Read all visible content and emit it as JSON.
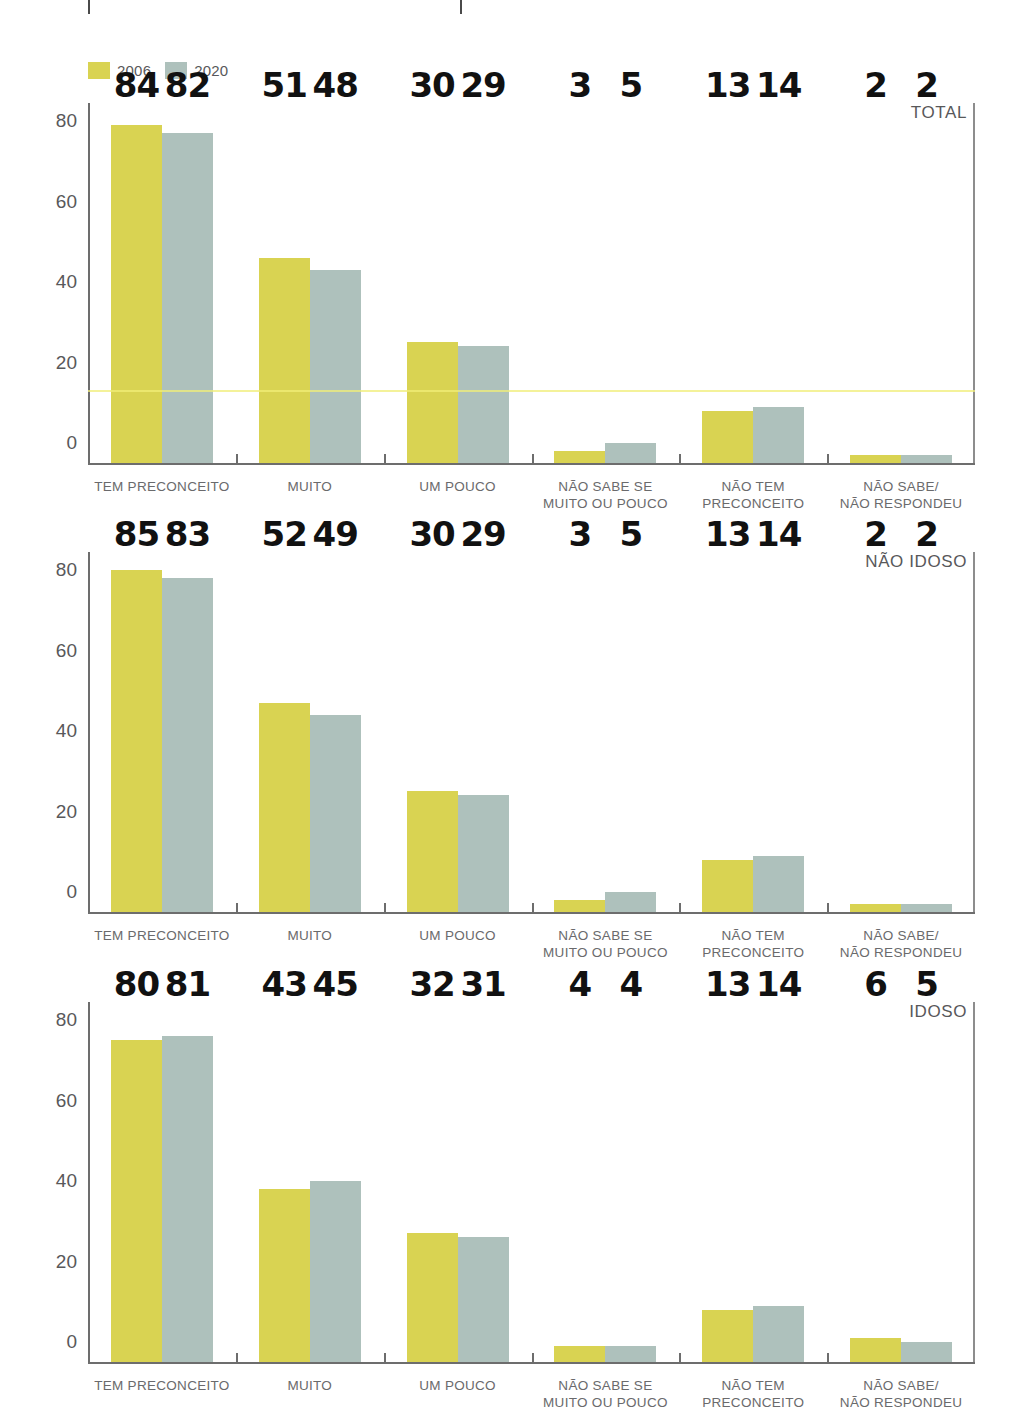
{
  "legend": {
    "items": [
      {
        "label": "2006",
        "color": "#d9d352"
      },
      {
        "label": "2020",
        "color": "#aec1bc"
      }
    ]
  },
  "colors": {
    "series_2006": "#d9d352",
    "series_2020": "#aec1bc",
    "axis": "#6d6d6d",
    "value_label": "#111111",
    "tick_label": "#58585a",
    "category_label": "#6a6a6c"
  },
  "chart_data": [
    {
      "type": "bar",
      "title": "TOTAL",
      "xlabel": "",
      "ylabel": "",
      "ylim": [
        0,
        90
      ],
      "yticks": [
        "0",
        "20",
        "40",
        "60",
        "80"
      ],
      "grid": false,
      "legend_position": "top-left",
      "categories": [
        "TEM PRECONCEITO",
        "MUITO",
        "UM POUCO",
        "NÃO SABE SE\nMUITO OU POUCO",
        "NÃO TEM\nPRECONCEITO",
        "NÃO SABE/\nNÃO RESPONDEU"
      ],
      "series": [
        {
          "name": "2006",
          "values": [
            84,
            51,
            30,
            3,
            13,
            2
          ]
        },
        {
          "name": "2020",
          "values": [
            82,
            48,
            29,
            5,
            14,
            2
          ]
        }
      ]
    },
    {
      "type": "bar",
      "title": "NÃO IDOSO",
      "xlabel": "",
      "ylabel": "",
      "ylim": [
        0,
        90
      ],
      "yticks": [
        "0",
        "20",
        "40",
        "60",
        "80"
      ],
      "grid": false,
      "legend_position": "none",
      "categories": [
        "TEM PRECONCEITO",
        "MUITO",
        "UM POUCO",
        "NÃO SABE SE\nMUITO OU POUCO",
        "NÃO TEM\nPRECONCEITO",
        "NÃO SABE/\nNÃO RESPONDEU"
      ],
      "series": [
        {
          "name": "2006",
          "values": [
            85,
            52,
            30,
            3,
            13,
            2
          ]
        },
        {
          "name": "2020",
          "values": [
            83,
            49,
            29,
            5,
            14,
            2
          ]
        }
      ]
    },
    {
      "type": "bar",
      "title": "IDOSO",
      "xlabel": "",
      "ylabel": "",
      "ylim": [
        0,
        90
      ],
      "yticks": [
        "0",
        "20",
        "40",
        "60",
        "80"
      ],
      "grid": false,
      "legend_position": "none",
      "categories": [
        "TEM PRECONCEITO",
        "MUITO",
        "UM POUCO",
        "NÃO SABE SE\nMUITO OU POUCO",
        "NÃO TEM\nPRECONCEITO",
        "NÃO SABE/\nNÃO RESPONDEU"
      ],
      "series": [
        {
          "name": "2006",
          "values": [
            80,
            43,
            32,
            4,
            13,
            6
          ]
        },
        {
          "name": "2020",
          "values": [
            81,
            45,
            31,
            4,
            14,
            5
          ]
        }
      ]
    }
  ]
}
